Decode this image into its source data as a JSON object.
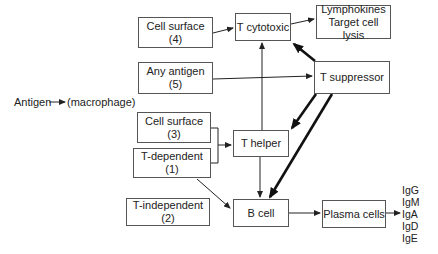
{
  "diagram": {
    "antigen_label": "Antigen",
    "macrophage_label": "(macrophage)",
    "nodes": {
      "cell_surface_4": "Cell surface (4)",
      "any_antigen_5": "Any antigen (5)",
      "cell_surface_3": "Cell surface (3)",
      "t_dependent_1": "T-dependent (1)",
      "t_independent_2": "T-independent (2)",
      "t_cytotoxic": "T cytotoxic",
      "lymphokines_line1": "Lymphokines",
      "lymphokines_line2": "Target cell lysis",
      "t_suppressor": "T suppressor",
      "t_helper": "T helper",
      "b_cell": "B cell",
      "plasma_cells": "Plasma cells"
    },
    "immunoglobulins": [
      "IgG",
      "IgM",
      "IgA",
      "IgD",
      "IgE"
    ],
    "edges": [
      {
        "from": "Antigen",
        "to": "(macrophage)",
        "style": "thin"
      },
      {
        "from": "Cell surface (4)",
        "to": "T cytotoxic",
        "style": "thin"
      },
      {
        "from": "T cytotoxic",
        "to": "Lymphokines / Target cell lysis",
        "style": "thin"
      },
      {
        "from": "Any antigen (5)",
        "to": "T suppressor",
        "style": "thin"
      },
      {
        "from": "Cell surface (3) + T-dependent (1)",
        "to": "T helper",
        "style": "thin"
      },
      {
        "from": "T helper",
        "to": "T cytotoxic",
        "style": "thin"
      },
      {
        "from": "T helper",
        "to": "B cell",
        "style": "thin"
      },
      {
        "from": "T-dependent (1)",
        "to": "B cell",
        "style": "thin"
      },
      {
        "from": "T suppressor",
        "to": "T cytotoxic",
        "style": "thick"
      },
      {
        "from": "T suppressor",
        "to": "T helper",
        "style": "thick"
      },
      {
        "from": "T suppressor",
        "to": "B cell",
        "style": "thick"
      },
      {
        "from": "B cell",
        "to": "Plasma cells",
        "style": "thin"
      },
      {
        "from": "Plasma cells",
        "to": "IgA",
        "style": "thin"
      }
    ],
    "colors": {
      "line": "#222222",
      "box_border": "#555555",
      "background": "#ffffff"
    }
  }
}
